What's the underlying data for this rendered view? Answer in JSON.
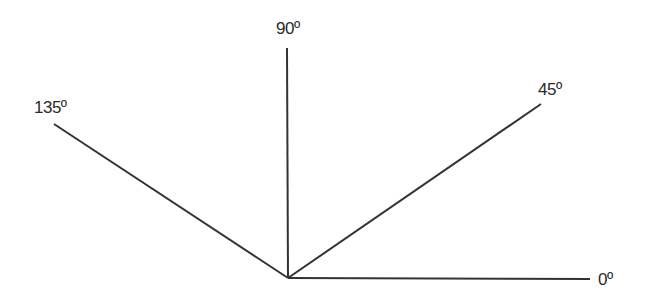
{
  "diagram": {
    "type": "angle-rays",
    "origin": {
      "x": 288,
      "y": 278
    },
    "line_color": "#333333",
    "rays": [
      {
        "angle_deg": 0,
        "label": "0º",
        "end": {
          "x": 590,
          "y": 279
        }
      },
      {
        "angle_deg": 45,
        "label": "45º",
        "end": {
          "x": 541,
          "y": 104
        }
      },
      {
        "angle_deg": 90,
        "label": "90º",
        "end": {
          "x": 287,
          "y": 48
        }
      },
      {
        "angle_deg": 135,
        "label": "135º",
        "end": {
          "x": 54,
          "y": 124
        }
      }
    ]
  }
}
